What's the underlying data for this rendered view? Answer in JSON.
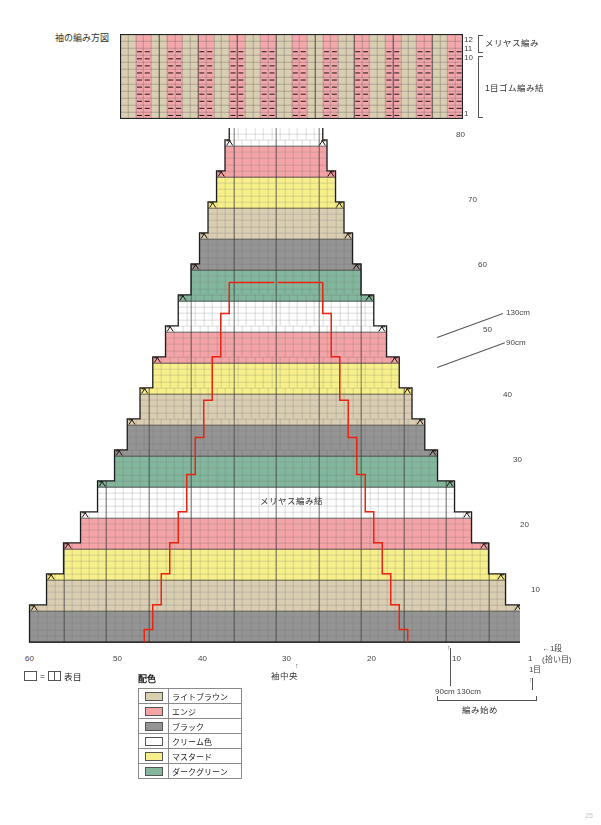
{
  "page": {
    "page_number": "25"
  },
  "cuff_chart": {
    "title": "袖の編み方図",
    "row_labels_top": [
      "12",
      "11",
      "10"
    ],
    "row_label_bottom": "1",
    "bracket_labels": {
      "upper": "メリヤス編み",
      "lower": "1目ゴム編み結"
    },
    "columns": 44,
    "rows": 12,
    "stockinette_rows": 2,
    "rib_rows": 10,
    "stripe_colors": [
      "#d9cdb2",
      "#f4a8ac"
    ],
    "dot_color": "#1a1a1a"
  },
  "sleeve_chart": {
    "center_label": "メリヤス編み結",
    "center_axis_label": "袖中央",
    "x_axis_ticks": [
      "60",
      "50",
      "40",
      "30",
      "20",
      "10",
      "1"
    ],
    "x_axis_tick_values": [
      60,
      50,
      40,
      30,
      20,
      10,
      1
    ],
    "y_axis_ticks": [
      "80",
      "70",
      "60",
      "50",
      "40",
      "30",
      "20",
      "10"
    ],
    "y_axis_tick_values": [
      80,
      70,
      60,
      50,
      40,
      30,
      20,
      10
    ],
    "size_annotations": [
      "130cm",
      "90cm"
    ],
    "bottom_annotations": {
      "first_row": "←1段",
      "pickup": "(拾い目)",
      "one_stitch": "1目",
      "sizes": "90cm 130cm",
      "start": "編み始め"
    },
    "guide_line_color": "#ee2211",
    "band_sequence": [
      "black",
      "light-brown",
      "mustard",
      "engi",
      "cream",
      "dark-green"
    ],
    "band_row_height": 5,
    "total_rows": 84,
    "total_cols": 60
  },
  "color_key": {
    "title": "配色",
    "entries": [
      {
        "name": "ライトブラウン",
        "hex": "#d9cdb2",
        "id": "light-brown"
      },
      {
        "name": "エンジ",
        "hex": "#f4a3a6",
        "id": "engi"
      },
      {
        "name": "ブラック",
        "hex": "#949494",
        "id": "black"
      },
      {
        "name": "クリーム色",
        "hex": "#ffffff",
        "id": "cream"
      },
      {
        "name": "マスタード",
        "hex": "#f7f08a",
        "id": "mustard"
      },
      {
        "name": "ダークグリーン",
        "hex": "#83b79d",
        "id": "dark-green"
      }
    ]
  },
  "stitch_key": {
    "equals": "=",
    "label": "表目"
  }
}
